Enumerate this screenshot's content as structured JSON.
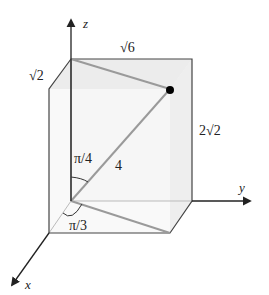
{
  "diagram": {
    "type": "3d-box-spherical-coordinates",
    "axes": {
      "x": {
        "label": "x"
      },
      "y": {
        "label": "y"
      },
      "z": {
        "label": "z"
      }
    },
    "dimensions": {
      "depth_label": "√2",
      "width_label": "√6",
      "height_label": "2√2"
    },
    "radius_label": "4",
    "angles": {
      "phi_label": "π/4",
      "theta_label": "π/3"
    },
    "colors": {
      "axis": "#222222",
      "box_edge": "#555555",
      "box_face": "#f2f2f2",
      "projection_line": "#9a9a9a",
      "point": "#000000"
    }
  }
}
